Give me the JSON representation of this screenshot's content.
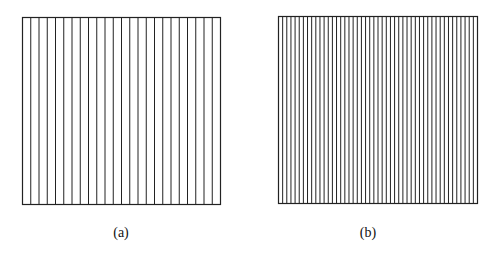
{
  "figure": {
    "panels": [
      {
        "id": "a",
        "caption": "(a)",
        "strips": 24,
        "vertical_lines": 25,
        "box": {
          "x": 22,
          "y": 17,
          "width": 198,
          "height": 187
        },
        "stroke_color": "#222222"
      },
      {
        "id": "b",
        "caption": "(b)",
        "strips": 48,
        "vertical_lines": 49,
        "box": {
          "x": 278,
          "y": 16,
          "width": 199,
          "height": 187
        },
        "stroke_color": "#222222"
      }
    ]
  }
}
